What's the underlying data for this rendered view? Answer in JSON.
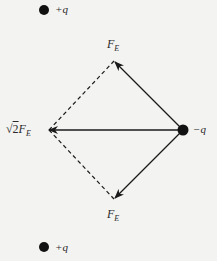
{
  "diagram": {
    "type": "electric-force-vector-diagram",
    "colors": {
      "background": "#f3f3f1",
      "ink": "#1a1a1a",
      "label": "#2a2a2a"
    },
    "charges": [
      {
        "id": "top",
        "sign": "+",
        "label": "+q",
        "cx": 44,
        "cy": 10
      },
      {
        "id": "bottom",
        "sign": "+",
        "label": "+q",
        "cx": 44,
        "cy": 247
      },
      {
        "id": "center",
        "sign": "-",
        "label": "−q",
        "cx": 183,
        "cy": 130
      }
    ],
    "vectors": [
      {
        "id": "force-up",
        "label_main": "F",
        "label_sub": "E",
        "from": [
          183,
          130
        ],
        "to": [
          114,
          61
        ],
        "style": "solid"
      },
      {
        "id": "force-down",
        "label_main": "F",
        "label_sub": "E",
        "from": [
          183,
          130
        ],
        "to": [
          114,
          199
        ],
        "style": "solid"
      },
      {
        "id": "net-force",
        "label_prefix": "√",
        "label_coef": "2",
        "label_main": "F",
        "label_sub": "E",
        "from": [
          183,
          130
        ],
        "to": [
          49,
          130
        ],
        "style": "solid"
      }
    ],
    "construction_lines": [
      {
        "id": "dash-upper",
        "from": [
          49,
          130
        ],
        "to": [
          114,
          61
        ],
        "style": "dashed"
      },
      {
        "id": "dash-lower",
        "from": [
          49,
          130
        ],
        "to": [
          114,
          199
        ],
        "style": "dashed"
      }
    ]
  }
}
